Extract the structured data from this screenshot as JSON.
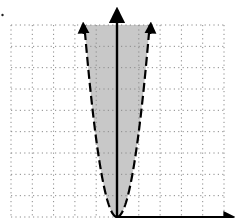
{
  "chart_data": {
    "type": "area",
    "title": "",
    "xlabel": "",
    "ylabel": "",
    "grid": true,
    "grid_style": "dotted",
    "grid_columns": 10,
    "grid_rows": 9,
    "xlim": [
      -5,
      5
    ],
    "ylim": [
      0,
      9
    ],
    "boundary": {
      "shape": "parabola",
      "vertex": [
        0,
        0
      ],
      "style": "dashed",
      "points": [
        [
          -1.55,
          9
        ],
        [
          -1.0,
          3.7
        ],
        [
          -0.5,
          0.9
        ],
        [
          0,
          0
        ],
        [
          0.5,
          0.9
        ],
        [
          1.0,
          3.7
        ],
        [
          1.55,
          9
        ]
      ]
    },
    "shaded_region": "inside (above) parabola",
    "shade_color": "#c8c8c8",
    "axis_color": "#000000",
    "x_ticks": [],
    "y_ticks": [],
    "legend": []
  }
}
